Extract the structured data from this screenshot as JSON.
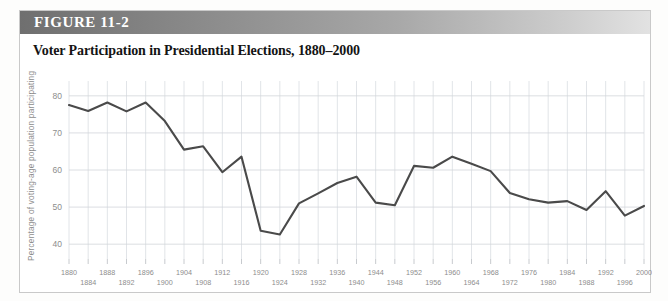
{
  "figure": {
    "label_prefix": "F",
    "label_rest": "IGURE",
    "label_number": "11-2",
    "label_full": "FIGURE 11-2",
    "title": "Voter Participation in Presidential Elections, 1880–2000"
  },
  "colors": {
    "header_dark": "#6f6f6f",
    "header_light": "#e2e2e2",
    "line": "#4a4a4a",
    "grid": "#d9dde2",
    "axis_text": "#8d8d8d",
    "page_background": "#ffffff"
  },
  "chart_data": {
    "type": "line",
    "title": "Voter Participation in Presidential Elections, 1880–2000",
    "xlabel": "",
    "ylabel": "Percentage of voting-age population participating",
    "ylim": [
      36,
      84
    ],
    "xlim": [
      1880,
      2000
    ],
    "grid": true,
    "legend": "none",
    "ytick_labels": [
      "40",
      "50",
      "60",
      "70",
      "80"
    ],
    "ytick_values": [
      40,
      50,
      60,
      70,
      80
    ],
    "xtick_labels_top": [
      "1880",
      "1888",
      "1896",
      "1904",
      "1912",
      "1920",
      "1928",
      "1936",
      "1944",
      "1952",
      "1960",
      "1968",
      "1976",
      "1984",
      "1992",
      "2000"
    ],
    "xtick_labels_bottom": [
      "1884",
      "1892",
      "1900",
      "1908",
      "1916",
      "1924",
      "1932",
      "1940",
      "1948",
      "1956",
      "1964",
      "1972",
      "1980",
      "1988",
      "1996"
    ],
    "x": [
      1880,
      1884,
      1888,
      1892,
      1896,
      1900,
      1904,
      1908,
      1912,
      1916,
      1920,
      1924,
      1928,
      1932,
      1936,
      1940,
      1944,
      1948,
      1952,
      1956,
      1960,
      1964,
      1968,
      1972,
      1976,
      1980,
      1984,
      1988,
      1992,
      1996,
      2000
    ],
    "values": [
      77.5,
      75.9,
      78.2,
      75.8,
      78.2,
      73.2,
      65.5,
      66.4,
      59.4,
      63.6,
      43.6,
      42.6,
      51.0,
      53.7,
      56.5,
      58.2,
      51.2,
      50.5,
      61.1,
      60.6,
      63.6,
      61.7,
      59.7,
      53.8,
      52.1,
      51.2,
      51.6,
      49.2,
      54.3,
      47.7,
      50.3
    ]
  }
}
